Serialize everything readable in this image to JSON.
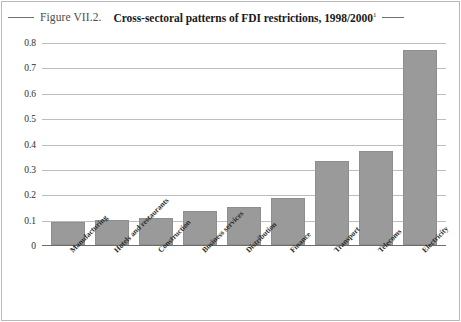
{
  "figure": {
    "label": "Figure VII.2.",
    "title": "Cross-sectoral patterns of FDI restrictions, 1998/2000",
    "title_footnote_marker": "1",
    "rule_left": "",
    "rule_right": ""
  },
  "colors": {
    "bar_fill": "#9a9a9a",
    "bar_border": "#8e8e8e",
    "gridline": "#bdbdbd",
    "axis": "#6d6d6d",
    "frame": "#b9b9b9",
    "label_text": "#2a2a2a",
    "title_text": "#1b1b1b",
    "figure_label_text": "#4c4c4c",
    "background": "#ffffff"
  },
  "chart_data": {
    "type": "bar",
    "title": "Cross-sectoral patterns of FDI restrictions, 1998/2000",
    "xlabel": "",
    "ylabel": "",
    "ylim": [
      0,
      0.8
    ],
    "yticks": [
      0,
      0.1,
      0.2,
      0.3,
      0.4,
      0.5,
      0.6,
      0.7,
      0.8
    ],
    "ytick_labels": [
      "0",
      "0.1",
      "0.2",
      "0.3",
      "0.4",
      "0.5",
      "0.6",
      "0.7",
      "0.8"
    ],
    "grid": true,
    "legend": "none",
    "orientation": "vertical",
    "xtick_rotation": -45,
    "categories": [
      "Manufacturing",
      "Hotels and restaurants",
      "Construction",
      "Business services",
      "Distribution",
      "Finance",
      "Transport",
      "Telecoms",
      "Electricity"
    ],
    "values": [
      0.09,
      0.1,
      0.105,
      0.135,
      0.15,
      0.185,
      0.33,
      0.37,
      0.77
    ],
    "series": [
      {
        "name": "FDI restrictions index",
        "values": [
          0.09,
          0.1,
          0.105,
          0.135,
          0.15,
          0.185,
          0.33,
          0.37,
          0.77
        ]
      }
    ]
  }
}
